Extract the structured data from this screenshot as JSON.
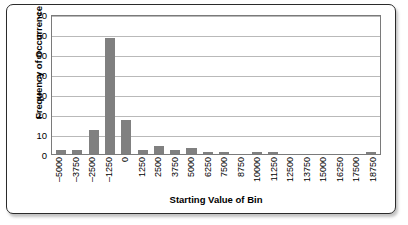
{
  "chart_data": {
    "type": "bar",
    "title": "",
    "xlabel": "Starting Value of Bin",
    "ylabel": "Frequency of Occurrence",
    "categories": [
      "-5000",
      "-3750",
      "-2500",
      "-1250",
      "0",
      "1250",
      "2500",
      "3750",
      "5000",
      "6250",
      "7500",
      "8750",
      "10000",
      "11250",
      "12500",
      "13750",
      "15000",
      "16250",
      "17500",
      "18750"
    ],
    "values": [
      2,
      2,
      12,
      58,
      17,
      2,
      4,
      2,
      3,
      1,
      1,
      0,
      1,
      1,
      0,
      0,
      0,
      0,
      0,
      1
    ],
    "ylim": [
      0,
      70
    ],
    "yticks": [
      0,
      10,
      20,
      30,
      40,
      50,
      60,
      70
    ],
    "grid": true,
    "legend": false,
    "bar_color": "#808080",
    "plot_background": "#ffffff",
    "gridline_color": "#b9b9b9",
    "border_color": "#2b2b2b"
  }
}
